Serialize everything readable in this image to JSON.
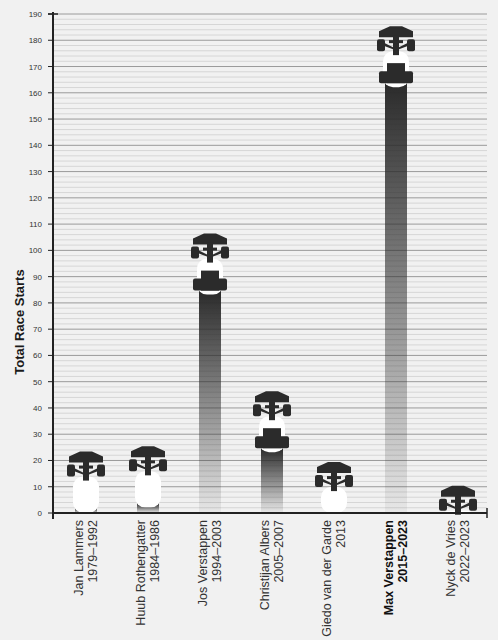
{
  "chart_data": {
    "type": "bar",
    "title": "",
    "xlabel": "",
    "ylabel": "Total Race Starts",
    "ylim": [
      0,
      190
    ],
    "yticks": [
      0,
      10,
      20,
      30,
      40,
      50,
      60,
      70,
      80,
      90,
      100,
      110,
      120,
      130,
      140,
      150,
      160,
      170,
      180,
      190
    ],
    "grid": true,
    "legend": null,
    "categories": [
      {
        "name": "Jan Lammers",
        "years": "1979–1992",
        "highlight": false
      },
      {
        "name": "Huub Rothengatter",
        "years": "1984–1986",
        "highlight": false
      },
      {
        "name": "Jos Verstappen",
        "years": "1994–2003",
        "highlight": false
      },
      {
        "name": "Christijan Albers",
        "years": "2005–2007",
        "highlight": false
      },
      {
        "name": "Giedo van der Garde",
        "years": "2013",
        "highlight": false
      },
      {
        "name": "Max Verstappen",
        "years": "2015–2023",
        "highlight": true
      },
      {
        "name": "Nyck de Vries",
        "years": "2022–2023",
        "highlight": false
      }
    ],
    "values": [
      23,
      25,
      106,
      46,
      19,
      185,
      10
    ],
    "bar_style": "top-down F1 car silhouette with fading exhaust trail"
  },
  "colors": {
    "background": "#f1f1f1",
    "car": "#2b2b2b",
    "major_grid": "#9a9a9a",
    "minor_grid": "#d6d6d6",
    "axis": "#222222"
  }
}
